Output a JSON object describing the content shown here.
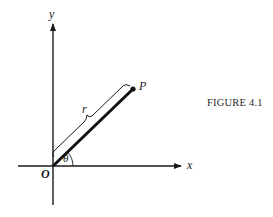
{
  "figure": {
    "caption": "FIGURE 4.1",
    "labels": {
      "y_axis": "y",
      "x_axis": "x",
      "origin": "O",
      "point": "P",
      "radius": "r",
      "angle": "θ"
    },
    "colors": {
      "ink": "#1a1a1a",
      "background": "#ffffff"
    }
  }
}
